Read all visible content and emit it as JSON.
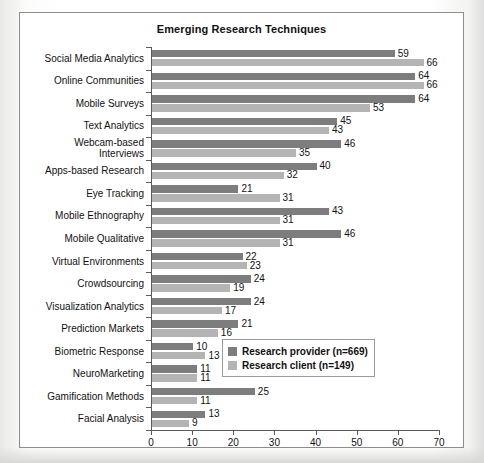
{
  "chart_data": {
    "type": "bar",
    "orientation": "horizontal",
    "title": "Emerging Research Techniques",
    "xlabel": "",
    "ylabel": "",
    "xlim": [
      0,
      70
    ],
    "xticks": [
      0,
      10,
      20,
      30,
      40,
      50,
      60,
      70
    ],
    "grid": false,
    "legend_position": "bottom-right",
    "categories": [
      "Social Media Analytics",
      "Online Communities",
      "Mobile Surveys",
      "Text Analytics",
      "Webcam-based Interviews",
      "Apps-based Research",
      "Eye Tracking",
      "Mobile Ethnography",
      "Mobile Qualitative",
      "Virtual Environments",
      "Crowdsourcing",
      "Visualization Analytics",
      "Prediction Markets",
      "Biometric Response",
      "NeuroMarketing",
      "Gamification Methods",
      "Facial Analysis"
    ],
    "series": [
      {
        "name": "Research provider (n=669)",
        "color": "#7d7d7d",
        "values": [
          59,
          64,
          64,
          45,
          46,
          40,
          21,
          43,
          46,
          22,
          24,
          24,
          21,
          10,
          11,
          25,
          13
        ]
      },
      {
        "name": "Research client (n=149)",
        "color": "#b4b4b4",
        "values": [
          66,
          66,
          53,
          43,
          35,
          32,
          31,
          31,
          31,
          23,
          19,
          17,
          16,
          13,
          11,
          11,
          9
        ]
      }
    ]
  },
  "legend": {
    "items": [
      {
        "label": "Research provider (n=669)",
        "color": "#7d7d7d"
      },
      {
        "label": "Research client (n=149)",
        "color": "#b4b4b4"
      }
    ]
  }
}
